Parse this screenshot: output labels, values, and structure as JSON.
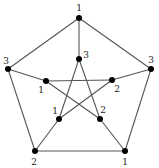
{
  "diagram": {
    "colors": {
      "edge": "#555555",
      "vertex": "#000000",
      "label": "#222222"
    },
    "vertices": [
      {
        "id": "o0",
        "x": 79,
        "y": 18,
        "label": "1",
        "lx": 79,
        "ly": 11
      },
      {
        "id": "o1",
        "x": 151,
        "y": 69,
        "label": "3",
        "lx": 151,
        "ly": 63
      },
      {
        "id": "o2",
        "x": 125,
        "y": 151,
        "label": "1",
        "lx": 125,
        "ly": 165
      },
      {
        "id": "o3",
        "x": 35,
        "y": 151,
        "label": "2",
        "lx": 34,
        "ly": 165
      },
      {
        "id": "o4",
        "x": 8,
        "y": 69,
        "label": "3",
        "lx": 6,
        "ly": 64
      },
      {
        "id": "i0",
        "x": 79,
        "y": 59,
        "label": "3",
        "lx": 86,
        "ly": 58
      },
      {
        "id": "i1",
        "x": 112,
        "y": 80,
        "label": "2",
        "lx": 117,
        "ly": 92
      },
      {
        "id": "i2",
        "x": 100,
        "y": 119,
        "label": "2",
        "lx": 103,
        "ly": 113
      },
      {
        "id": "i3",
        "x": 59,
        "y": 119,
        "label": "1",
        "lx": 55,
        "ly": 114
      },
      {
        "id": "i4",
        "x": 46,
        "y": 81,
        "label": "1",
        "lx": 41,
        "ly": 93
      }
    ],
    "edges": [
      [
        "o0",
        "o1"
      ],
      [
        "o1",
        "o2"
      ],
      [
        "o2",
        "o3"
      ],
      [
        "o3",
        "o4"
      ],
      [
        "o4",
        "o0"
      ],
      [
        "o0",
        "i0"
      ],
      [
        "o1",
        "i1"
      ],
      [
        "o2",
        "i2"
      ],
      [
        "o3",
        "i3"
      ],
      [
        "o4",
        "i4"
      ],
      [
        "i0",
        "i2"
      ],
      [
        "i0",
        "i3"
      ],
      [
        "i4",
        "i1"
      ],
      [
        "i4",
        "i2"
      ],
      [
        "i1",
        "i3"
      ]
    ]
  }
}
